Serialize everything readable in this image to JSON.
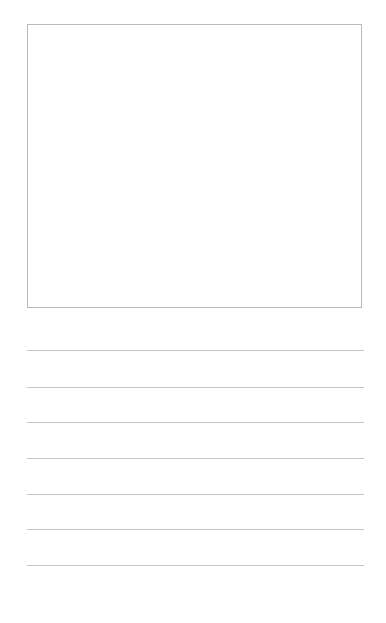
{
  "page": {
    "type": "blank worksheet",
    "drawing_box": {
      "label": ""
    },
    "writing_lines": [
      {
        "top": 350
      },
      {
        "top": 387
      },
      {
        "top": 422
      },
      {
        "top": 458
      },
      {
        "top": 494
      },
      {
        "top": 529
      },
      {
        "top": 565
      }
    ]
  }
}
